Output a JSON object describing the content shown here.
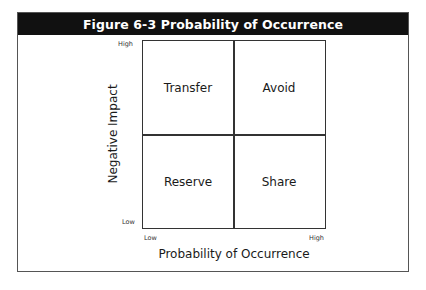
{
  "figure": {
    "title": "Figure 6-3  Probability of Occurrence",
    "quadrants": {
      "top_left": "Transfer",
      "top_right": "Avoid",
      "bottom_left": "Reserve",
      "bottom_right": "Share"
    },
    "y_axis": {
      "label": "Negative Impact",
      "high": "High",
      "low": "Low"
    },
    "x_axis": {
      "label": "Probability of Occurrence",
      "low": "Low",
      "high": "High"
    },
    "colors": {
      "title_bar": "#111111",
      "title_text": "#ffffff",
      "lines": "#333333"
    }
  }
}
